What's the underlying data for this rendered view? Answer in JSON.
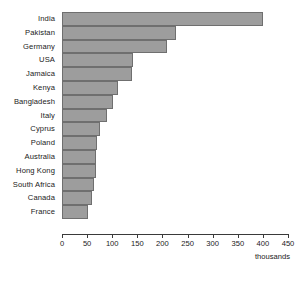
{
  "chart_data": {
    "type": "bar",
    "orientation": "horizontal",
    "title": "",
    "xlabel": "thousands",
    "ylabel": "",
    "xlim": [
      0,
      450
    ],
    "xticks": [
      0,
      50,
      100,
      150,
      200,
      250,
      300,
      350,
      400,
      450
    ],
    "grid": false,
    "legend": null,
    "bar_color": "#9d9d9d",
    "bar_edge_color": "#6f6f6f",
    "categories": [
      "India",
      "Pakistan",
      "Germany",
      "USA",
      "Jamaica",
      "Kenya",
      "Bangladesh",
      "Italy",
      "Cyprus",
      "Poland",
      "Australia",
      "Hong Kong",
      "South Africa",
      "Canada",
      "France"
    ],
    "values": [
      400,
      227,
      209,
      141,
      139,
      112,
      102,
      90,
      76,
      70,
      68,
      68,
      64,
      60,
      52
    ]
  },
  "axis": {
    "unit_label": "thousands",
    "tick_labels": [
      "0",
      "50",
      "100",
      "150",
      "200",
      "250",
      "300",
      "350",
      "400",
      "450"
    ]
  }
}
